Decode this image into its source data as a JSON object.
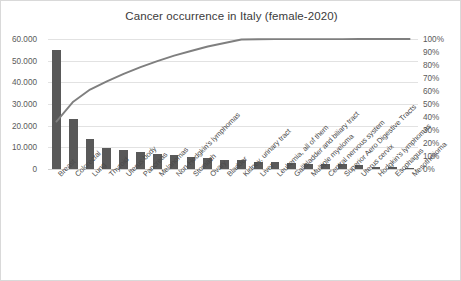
{
  "chart_data": {
    "type": "bar",
    "title": "Cancer occurrence in Italy (female-2020)",
    "xlabel": "",
    "ylabel": "",
    "ylim": [
      0,
      60000
    ],
    "y2lim": [
      0,
      100
    ],
    "grid": true,
    "legend": "none",
    "categories": [
      "Breast",
      "Colorectal",
      "Lung",
      "Thyroid",
      "Uterus body",
      "Pancreas",
      "Melanomas",
      "Non-Hodgkin's lymphomas",
      "Stomach",
      "Ovary",
      "Bladder",
      "Kidney, urinary tract",
      "Liver",
      "Leukemia, all of them",
      "Gallbladder and biliary tract",
      "Multiple myeloma",
      "Central nervous system",
      "Superior Aero Digestive Tracts",
      "Uterus cervix",
      "Hodgkin's lymphomas",
      "Esophagus",
      "Mesothelioma"
    ],
    "values": [
      55000,
      23000,
      14000,
      9500,
      8700,
      7800,
      7000,
      6300,
      5400,
      5200,
      4100,
      4000,
      3300,
      3200,
      2800,
      2500,
      2400,
      2100,
      2000,
      800,
      700,
      500
    ],
    "cumulative_percent": [
      36.5,
      51.8,
      61.1,
      67.4,
      73.2,
      78.4,
      83.0,
      87.2,
      90.8,
      94.2,
      96.9,
      99.6,
      99.8,
      99.9,
      99.9,
      99.9,
      99.9,
      99.9,
      100.0,
      100.0,
      100.0,
      100.0
    ],
    "y_ticks": [
      "0",
      "10.000",
      "20.000",
      "30.000",
      "40.000",
      "50.000",
      "60.000"
    ],
    "y_tick_values": [
      0,
      10000,
      20000,
      30000,
      40000,
      50000,
      60000
    ],
    "y2_ticks": [
      "0%",
      "10%",
      "20%",
      "30%",
      "40%",
      "50%",
      "60%",
      "70%",
      "80%",
      "90%",
      "100%"
    ],
    "y2_tick_values": [
      0,
      10,
      20,
      30,
      40,
      50,
      60,
      70,
      80,
      90,
      100
    ],
    "colors": {
      "bar": "#595959",
      "line": "#7f7f7f",
      "grid": "#e2e2e2",
      "text": "#5a5a5a",
      "title": "#3b3b3b",
      "border": "#d9d9d9",
      "background": "#ffffff"
    }
  }
}
